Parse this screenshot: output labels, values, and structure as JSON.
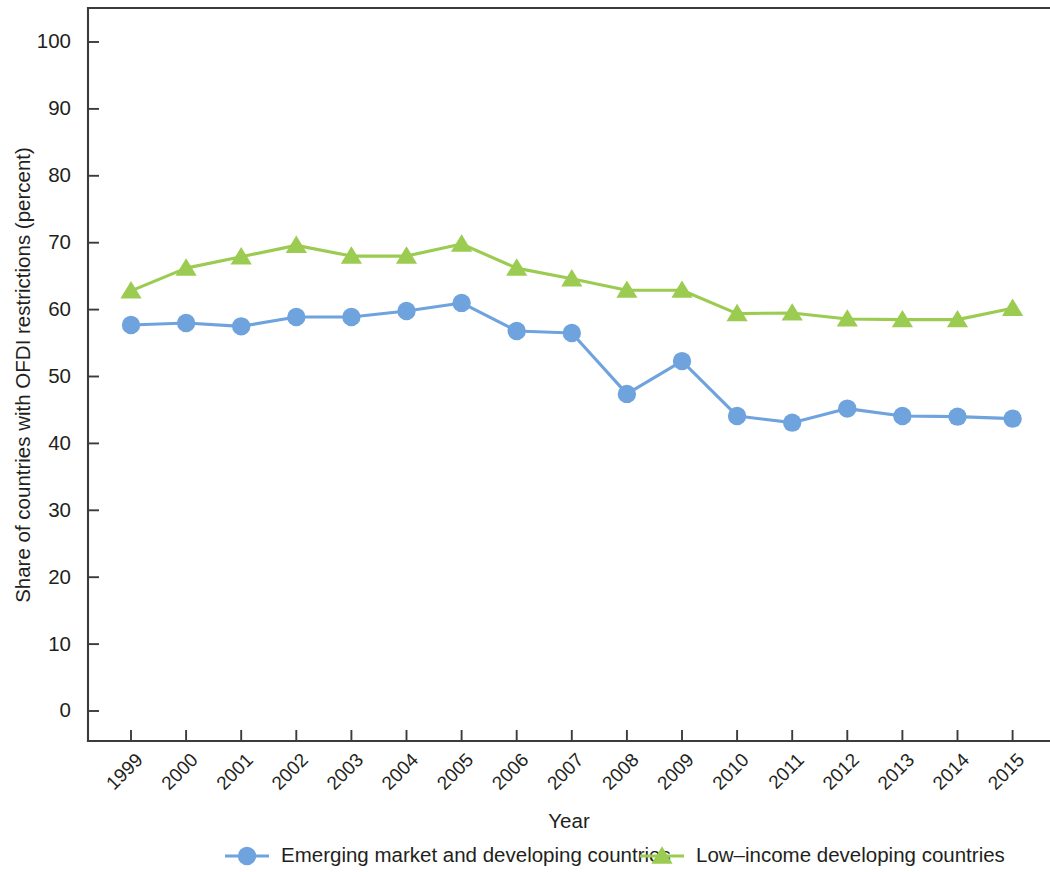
{
  "chart_data": {
    "type": "line",
    "title": "",
    "xlabel": "Year",
    "ylabel": "Share of countries with OFDI restrictions (percent)",
    "categories": [
      "1999",
      "2000",
      "2001",
      "2002",
      "2003",
      "2004",
      "2005",
      "2006",
      "2007",
      "2008",
      "2009",
      "2010",
      "2011",
      "2012",
      "2013",
      "2014",
      "2015"
    ],
    "x": [
      1999,
      2000,
      2001,
      2002,
      2003,
      2004,
      2005,
      2006,
      2007,
      2008,
      2009,
      2010,
      2011,
      2012,
      2013,
      2014,
      2015
    ],
    "ylim": [
      0,
      105
    ],
    "xlim": [
      1998.5,
      2015.5
    ],
    "yticks": [
      0,
      10,
      20,
      30,
      40,
      50,
      60,
      70,
      80,
      90,
      100
    ],
    "ytick_labels": [
      "0",
      "10",
      "20",
      "30",
      "40",
      "50",
      "60",
      "70",
      "80",
      "90",
      "100"
    ],
    "grid": false,
    "legend_position": "bottom",
    "series": [
      {
        "name": "Emerging market and developing countries",
        "color": "#6fa3de",
        "marker": "circle",
        "values": [
          57.7,
          58.0,
          57.5,
          58.9,
          58.9,
          59.8,
          61.0,
          56.8,
          56.5,
          47.4,
          52.3,
          44.1,
          43.1,
          45.2,
          44.1,
          44.0,
          43.7
        ]
      },
      {
        "name": "Low–income developing countries",
        "color": "#9bcb50",
        "marker": "triangle",
        "values": [
          62.8,
          66.2,
          67.9,
          69.6,
          68.0,
          68.0,
          69.8,
          66.2,
          64.6,
          62.9,
          62.9,
          59.4,
          59.5,
          58.6,
          58.5,
          58.5,
          60.2
        ]
      }
    ]
  },
  "axes": {
    "y_title": "Share of countries with OFDI restrictions (percent)",
    "x_title": "Year"
  },
  "legend": {
    "items": [
      {
        "label": "Emerging market and developing countries",
        "color": "#6fa3de",
        "marker": "circle"
      },
      {
        "label": "Low–income developing countries",
        "color": "#9bcb50",
        "marker": "triangle"
      }
    ]
  },
  "colors": {
    "series_blue": "#6fa3de",
    "series_green": "#9bcb50",
    "axis": "#3b3b3b",
    "text": "#231f20",
    "background": "#ffffff"
  }
}
